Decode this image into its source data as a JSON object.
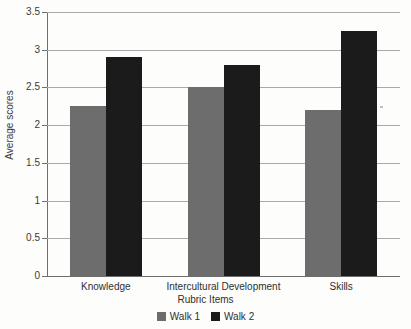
{
  "page": {
    "clipped_top_text": "....."
  },
  "chart_data": {
    "type": "bar",
    "title": "",
    "subtitle": "",
    "xlabel": "Rubric Items",
    "ylabel": "Average scores",
    "categories": [
      "Knowledge",
      "Intercultural Development",
      "Skills"
    ],
    "series": [
      {
        "name": "Walk 1",
        "color": "#6d6d6d",
        "values": [
          2.25,
          2.5,
          2.2
        ]
      },
      {
        "name": "Walk 2",
        "color": "#1b1b1b",
        "values": [
          2.9,
          2.8,
          3.25
        ]
      }
    ],
    "ylim": [
      0,
      3.5
    ],
    "ytick_values": [
      0,
      0.5,
      1,
      1.5,
      2,
      2.5,
      3,
      3.5
    ],
    "ytick_labels": [
      "0",
      "0.5",
      "1",
      "1.5",
      "2",
      "2.5",
      "3",
      "3.5"
    ],
    "grid": "horizontal",
    "legend_position": "bottom",
    "legend": [
      "Walk 1",
      "Walk 2"
    ]
  }
}
